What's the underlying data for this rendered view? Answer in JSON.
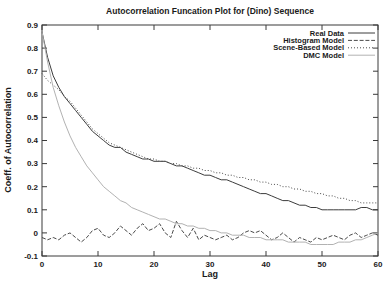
{
  "chart_data": {
    "type": "line",
    "title": "Autocorrelation Funcation Plot for (Dino) Sequence",
    "xlabel": "Lag",
    "ylabel": "Coeff. of Autocorrelation",
    "xlim": [
      0,
      60
    ],
    "ylim": [
      -0.1,
      0.9
    ],
    "xticks": [
      0,
      10,
      20,
      30,
      40,
      50,
      60
    ],
    "yticks": [
      -0.1,
      0,
      0.1,
      0.2,
      0.3,
      0.4,
      0.5,
      0.6,
      0.7,
      0.8,
      0.9
    ],
    "grid": false,
    "legend_position": "top-right-inside",
    "frame_color": "#3a3a3a",
    "text_color": "#1a1a1a",
    "x": [
      0,
      1,
      2,
      3,
      4,
      5,
      6,
      7,
      8,
      9,
      10,
      11,
      12,
      13,
      14,
      15,
      16,
      17,
      18,
      19,
      20,
      21,
      22,
      23,
      24,
      25,
      26,
      27,
      28,
      29,
      30,
      31,
      32,
      33,
      34,
      35,
      36,
      37,
      38,
      39,
      40,
      41,
      42,
      43,
      44,
      45,
      46,
      47,
      48,
      49,
      50,
      51,
      52,
      53,
      54,
      55,
      56,
      57,
      58,
      59,
      60
    ],
    "series": [
      {
        "name": "Real Data",
        "style": "solid",
        "color": "#3c3c3c",
        "values": [
          0.87,
          0.76,
          0.68,
          0.63,
          0.59,
          0.56,
          0.53,
          0.5,
          0.47,
          0.44,
          0.42,
          0.4,
          0.38,
          0.37,
          0.37,
          0.35,
          0.34,
          0.33,
          0.32,
          0.32,
          0.31,
          0.31,
          0.31,
          0.3,
          0.29,
          0.29,
          0.28,
          0.27,
          0.26,
          0.25,
          0.25,
          0.24,
          0.23,
          0.23,
          0.22,
          0.21,
          0.2,
          0.19,
          0.18,
          0.17,
          0.17,
          0.16,
          0.15,
          0.14,
          0.14,
          0.13,
          0.12,
          0.12,
          0.11,
          0.11,
          0.1,
          0.1,
          0.1,
          0.1,
          0.1,
          0.1,
          0.1,
          0.11,
          0.11,
          0.1,
          0.1
        ]
      },
      {
        "name": "Histogram Model",
        "style": "dashed",
        "color": "#4a4a4a",
        "values": [
          -0.02,
          -0.03,
          -0.02,
          -0.03,
          -0.01,
          0.0,
          -0.02,
          -0.04,
          -0.02,
          0.01,
          0.02,
          -0.01,
          -0.02,
          0.0,
          0.03,
          0.01,
          -0.01,
          0.02,
          0.04,
          0.01,
          0.02,
          0.04,
          0.0,
          -0.02,
          0.05,
          0.01,
          -0.02,
          0.02,
          -0.03,
          -0.01,
          -0.02,
          -0.03,
          -0.02,
          -0.01,
          -0.03,
          -0.02,
          0.0,
          0.01,
          0.0,
          0.01,
          -0.01,
          -0.03,
          -0.02,
          0.0,
          -0.02,
          -0.04,
          -0.02,
          -0.03,
          -0.04,
          -0.02,
          -0.03,
          -0.02,
          -0.01,
          -0.02,
          -0.03,
          -0.01,
          0.0,
          -0.02,
          -0.01,
          0.0,
          -0.01
        ]
      },
      {
        "name": "Scene-Based Model",
        "style": "dotted",
        "color": "#4a4a4a",
        "values": [
          0.69,
          0.66,
          0.64,
          0.62,
          0.59,
          0.57,
          0.54,
          0.51,
          0.48,
          0.45,
          0.43,
          0.41,
          0.39,
          0.38,
          0.37,
          0.36,
          0.35,
          0.34,
          0.33,
          0.32,
          0.32,
          0.31,
          0.31,
          0.3,
          0.3,
          0.29,
          0.29,
          0.28,
          0.28,
          0.27,
          0.27,
          0.26,
          0.26,
          0.25,
          0.25,
          0.24,
          0.24,
          0.23,
          0.23,
          0.22,
          0.22,
          0.21,
          0.21,
          0.2,
          0.2,
          0.19,
          0.19,
          0.18,
          0.18,
          0.17,
          0.17,
          0.16,
          0.16,
          0.15,
          0.15,
          0.14,
          0.14,
          0.13,
          0.13,
          0.13,
          0.13
        ]
      },
      {
        "name": "DMC Model",
        "style": "solid",
        "color": "#b2b2b2",
        "values": [
          0.87,
          0.74,
          0.63,
          0.55,
          0.48,
          0.42,
          0.37,
          0.33,
          0.29,
          0.26,
          0.23,
          0.2,
          0.18,
          0.16,
          0.14,
          0.13,
          0.11,
          0.1,
          0.09,
          0.08,
          0.07,
          0.06,
          0.06,
          0.05,
          0.04,
          0.04,
          0.03,
          0.03,
          0.02,
          0.02,
          0.01,
          0.01,
          0.0,
          0.0,
          -0.01,
          -0.01,
          -0.01,
          -0.02,
          -0.02,
          -0.02,
          -0.03,
          -0.03,
          -0.03,
          -0.03,
          -0.04,
          -0.04,
          -0.04,
          -0.04,
          -0.05,
          -0.05,
          -0.05,
          -0.05,
          -0.05,
          -0.04,
          -0.04,
          -0.04,
          -0.03,
          -0.03,
          -0.02,
          -0.01,
          0.0
        ]
      }
    ]
  }
}
